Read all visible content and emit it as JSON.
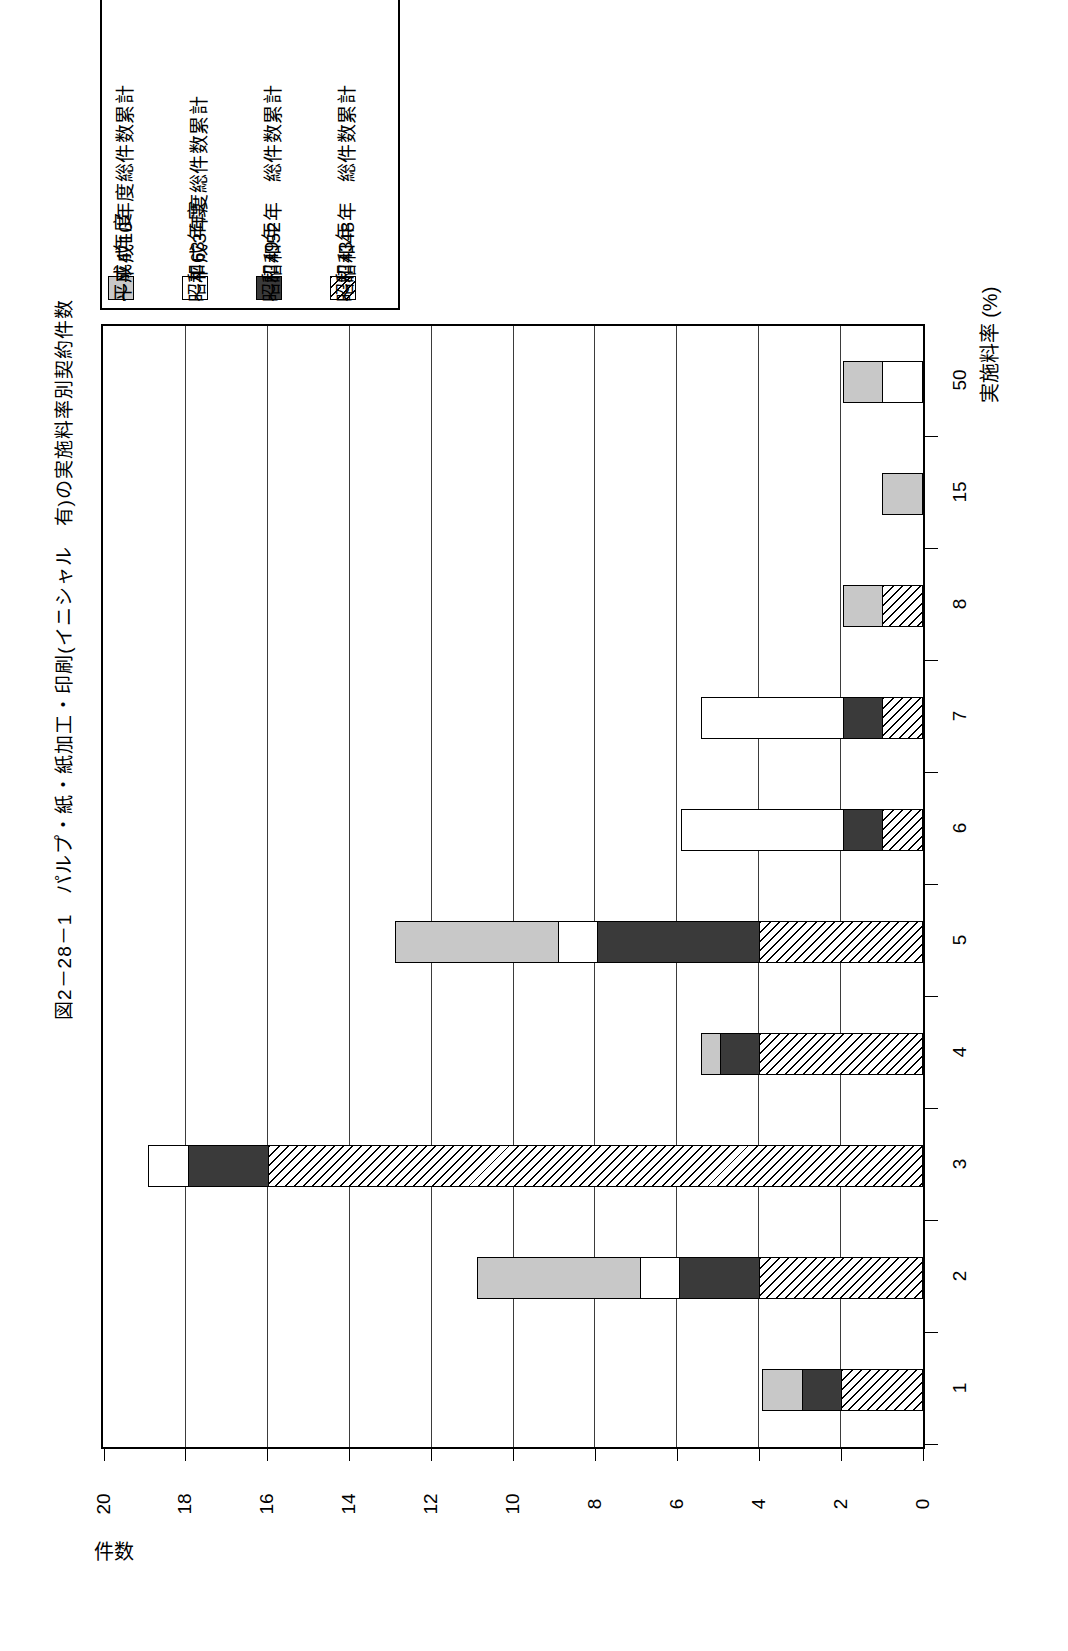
{
  "figure": {
    "title": "図2－28－1　パルプ・紙・紙加工・印刷(イニシャル　有)の実施料率別契約件数"
  },
  "legend": {
    "items": [
      {
        "label": "平成4年度",
        "swatch": "gray-swatch",
        "fill": "#c8c8c8"
      },
      {
        "label": "～平成10年度総件数累計",
        "swatch": "gray-swatch-label",
        "fill": "#c8c8c8"
      },
      {
        "label": "昭和63年度",
        "swatch": "white-swatch",
        "fill": "#ffffff"
      },
      {
        "label": "～平成3年度総件数累計",
        "swatch": "white-swatch-label",
        "fill": "#ffffff"
      },
      {
        "label": "昭和49年",
        "swatch": "dark-swatch",
        "fill": "#3a3a3a"
      },
      {
        "label": "～昭和52年　総件数累計",
        "swatch": "dark-swatch-label",
        "fill": "#3a3a3a"
      },
      {
        "label": "昭和43年",
        "swatch": "hatch-swatch",
        "fill": "hatch"
      },
      {
        "label": "～昭和48年　総件数累計",
        "swatch": "hatch-swatch-label",
        "fill": "hatch"
      }
    ]
  },
  "axes": {
    "value_axis_title": "件数",
    "value_ticks": [
      "20",
      "18",
      "16",
      "14",
      "12",
      "10",
      "8",
      "6",
      "4",
      "2",
      "0"
    ],
    "value_min": 0,
    "value_max": 20,
    "category_axis_title": "実施料率 (%)",
    "category_ticks": [
      "50",
      "15",
      "8",
      "7",
      "6",
      "5",
      "4",
      "3",
      "2",
      "1"
    ]
  },
  "chart_data": {
    "type": "bar",
    "title": "図2－28－1　パルプ・紙・紙加工・印刷(イニシャル　有)の実施料率別契約件数",
    "orientation": "horizontal",
    "stacked": true,
    "xlabel": "実施料率 (%)",
    "ylabel": "件数",
    "ylim": [
      0,
      20
    ],
    "grid": true,
    "legend_position": "top-left",
    "categories": [
      "50",
      "15",
      "8",
      "7",
      "6",
      "5",
      "4",
      "3",
      "2",
      "1"
    ],
    "series": [
      {
        "name": "昭和43年～昭和48年 総件数累計",
        "fill": "hatch",
        "values": [
          0,
          0,
          1,
          1,
          1,
          4,
          4,
          16,
          4,
          2
        ]
      },
      {
        "name": "昭和49年～昭和52年 総件数累計",
        "fill": "#3a3a3a",
        "values": [
          0,
          0,
          0,
          1,
          1,
          4,
          1,
          2,
          2,
          1
        ]
      },
      {
        "name": "昭和63年度～平成3年度総件数累計",
        "fill": "#ffffff",
        "values": [
          1,
          0,
          0,
          3.5,
          4,
          1,
          0,
          1,
          1,
          0
        ]
      },
      {
        "name": "平成4年度～平成10年度総件数累計",
        "fill": "#c8c8c8",
        "values": [
          1,
          1,
          1,
          0,
          0,
          4,
          0.5,
          0,
          4,
          1
        ]
      }
    ],
    "totals": [
      2,
      1,
      2,
      5.5,
      6,
      13,
      5.5,
      19,
      11,
      4
    ]
  },
  "colors": {
    "gray": "#c8c8c8",
    "white": "#ffffff",
    "dark": "#3a3a3a",
    "line": "#000000"
  }
}
